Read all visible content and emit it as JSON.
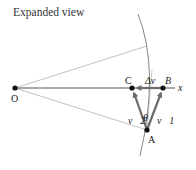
{
  "title": "Expanded view",
  "points": {
    "O": {
      "label": "O",
      "x": 15,
      "y": 88
    },
    "C": {
      "label": "C",
      "x": 132,
      "y": 88
    },
    "B": {
      "label": "B",
      "x": 163,
      "y": 88
    },
    "A": {
      "label": "A",
      "x": 147,
      "y": 130
    }
  },
  "axis_label": "x",
  "vectors": {
    "v1": "v⃗1",
    "v2": "v⃗2",
    "delta_v": "Δv⃗"
  },
  "angle_label": "θ",
  "colors": {
    "vector": "#6b6b6b",
    "line": "#888888",
    "axis": "#555555",
    "point": "#111111"
  }
}
